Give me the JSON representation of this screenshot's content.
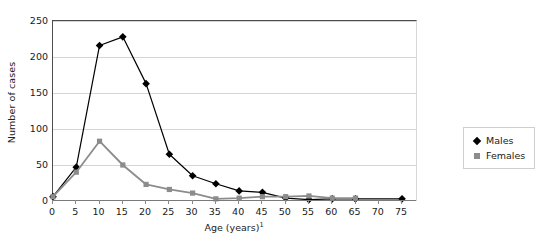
{
  "chart_data": {
    "type": "line",
    "title": "",
    "xlabel": "Age (years)",
    "xlabel_superscript": "1",
    "ylabel": "Number of cases",
    "x": [
      0,
      5,
      10,
      15,
      20,
      25,
      30,
      35,
      40,
      45,
      50,
      55,
      60,
      65,
      70,
      75
    ],
    "xlim": [
      0,
      78
    ],
    "ylim": [
      0,
      250
    ],
    "xticks": [
      0,
      5,
      10,
      15,
      20,
      25,
      30,
      35,
      40,
      45,
      50,
      55,
      60,
      65,
      70,
      75
    ],
    "yticks": [
      0,
      50,
      100,
      150,
      200,
      250
    ],
    "grid": "horizontal",
    "legend_position": "right",
    "series": [
      {
        "name": "Males",
        "color": "#000000",
        "marker": "diamond",
        "x": [
          0,
          5,
          10,
          15,
          20,
          25,
          30,
          35,
          40,
          45,
          50,
          55,
          60,
          65,
          75
        ],
        "values": [
          6,
          47,
          216,
          228,
          163,
          65,
          35,
          24,
          14,
          12,
          4,
          2,
          3,
          3,
          3
        ]
      },
      {
        "name": "Females",
        "color": "#8c8c8c",
        "marker": "square",
        "x": [
          0,
          5,
          10,
          15,
          20,
          25,
          30,
          35,
          40,
          45,
          50,
          55,
          60,
          65
        ],
        "values": [
          6,
          40,
          83,
          50,
          23,
          16,
          11,
          3,
          4,
          6,
          6,
          7,
          4,
          4
        ]
      }
    ]
  },
  "axes": {
    "y_title": "Number of cases",
    "y_tick_labels": [
      "0",
      "50",
      "100",
      "150",
      "200",
      "250"
    ],
    "x_tick_labels": [
      "0",
      "5",
      "10",
      "15",
      "20",
      "25",
      "30",
      "35",
      "40",
      "45",
      "50",
      "55",
      "60",
      "65",
      "70",
      "75"
    ],
    "x_title_text": "Age (years)",
    "x_title_superscript": "1"
  },
  "legend": {
    "entries": [
      {
        "label": "Males",
        "marker": "diamond-marker",
        "color": "#000000"
      },
      {
        "label": "Females",
        "marker": "square-marker",
        "color": "#8c8c8c"
      }
    ]
  }
}
